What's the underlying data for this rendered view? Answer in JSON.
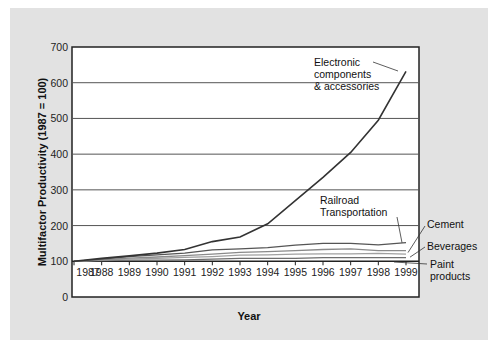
{
  "chart_data": {
    "type": "line",
    "title": "",
    "xlabel": "Year",
    "ylabel": "Multifactor Productivity (1987 = 100)",
    "ylim": [
      0,
      700
    ],
    "yticks": [
      0,
      100,
      200,
      300,
      400,
      500,
      600,
      700
    ],
    "grid": true,
    "x": [
      "1987",
      "1988",
      "1989",
      "1990",
      "1991",
      "1992",
      "1993",
      "1994",
      "1995",
      "1996",
      "1997",
      "1998",
      "1999"
    ],
    "series": [
      {
        "name": "Electronic components & accessories",
        "label_lines": [
          "Electronic",
          "components",
          "& accessories"
        ],
        "color": "#333333",
        "values": [
          100,
          108,
          115,
          123,
          133,
          155,
          168,
          205,
          270,
          335,
          405,
          495,
          632
        ]
      },
      {
        "name": "Railroad Transportation",
        "label_lines": [
          "Railroad",
          "Transportation"
        ],
        "color": "#555555",
        "values": [
          100,
          106,
          113,
          118,
          123,
          132,
          135,
          138,
          145,
          150,
          150,
          146,
          152
        ]
      },
      {
        "name": "Cement",
        "label_lines": [
          "Cement"
        ],
        "color": "#8a8a8a",
        "values": [
          100,
          104,
          109,
          112,
          116,
          120,
          125,
          127,
          130,
          133,
          135,
          130,
          130
        ]
      },
      {
        "name": "Beverages",
        "label_lines": [
          "Beverages"
        ],
        "color": "#a0a0a0",
        "values": [
          100,
          103,
          106,
          108,
          111,
          113,
          117,
          118,
          120,
          121,
          121,
          122,
          120
        ]
      },
      {
        "name": "Paint products",
        "label_lines": [
          "Paint",
          "products"
        ],
        "color": "#6e6e6e",
        "values": [
          100,
          102,
          103,
          103,
          104,
          106,
          108,
          108,
          108,
          110,
          110,
          110,
          110
        ]
      }
    ]
  }
}
